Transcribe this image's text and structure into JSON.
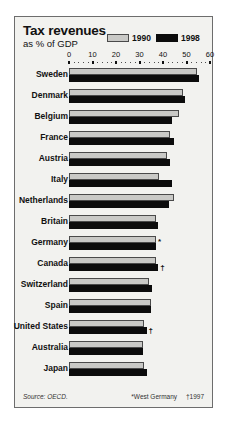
{
  "header": {
    "title": "Tax revenues",
    "subtitle": "as % of GDP"
  },
  "legend": [
    {
      "label": "1990",
      "color": "#c9c9c6",
      "swatch": "light"
    },
    {
      "label": "1998",
      "color": "#0c0c0c",
      "swatch": "dark"
    }
  ],
  "footer": {
    "source": "Source: OECD.",
    "note_star": "*West Germany",
    "note_dagger": "†1997"
  },
  "chart_data": {
    "type": "bar",
    "orientation": "horizontal",
    "title": "Tax revenues",
    "subtitle": "as % of GDP",
    "xlabel": "",
    "ylabel": "",
    "xlim": [
      0,
      60
    ],
    "xticks": [
      0,
      10,
      20,
      30,
      40,
      50,
      60
    ],
    "xticklabels": [
      "0",
      "10",
      "20",
      "30",
      "40",
      "50",
      "60"
    ],
    "grid": false,
    "legend_position": "top-right",
    "categories": [
      "Sweden",
      "Denmark",
      "Belgium",
      "France",
      "Austria",
      "Italy",
      "Netherlands",
      "Britain",
      "Germany",
      "Canada",
      "Switzerland",
      "Spain",
      "United States",
      "Australia",
      "Japan"
    ],
    "markers": {
      "Germany": "*",
      "Canada": "†",
      "United States": "†"
    },
    "series": [
      {
        "name": "1990",
        "color": "#c9c9c6",
        "values": [
          54.5,
          48.5,
          47.0,
          43.0,
          41.5,
          38.5,
          44.5,
          37.0,
          37.0,
          37.0,
          34.0,
          35.0,
          32.0,
          31.5,
          32.0
        ]
      },
      {
        "name": "1998",
        "color": "#0c0c0c",
        "values": [
          55.5,
          49.5,
          44.0,
          44.5,
          43.0,
          44.0,
          42.5,
          38.0,
          37.0,
          38.0,
          35.5,
          35.0,
          33.0,
          31.5,
          33.0
        ]
      }
    ]
  }
}
